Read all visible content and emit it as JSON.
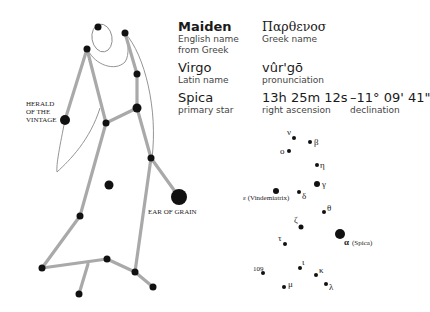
{
  "info": {
    "english_name": {
      "value": "Maiden",
      "label_1": "English name",
      "label_2": "from Greek"
    },
    "greek_name": {
      "value": "Παρθενοσ",
      "label": "Greek name"
    },
    "latin_name": {
      "value": "Virgo",
      "label": "Latin name"
    },
    "pronunciation": {
      "value": "vûr'gō",
      "label": "pronunciation"
    },
    "primary_star": {
      "value": "Spica",
      "label": "primary star"
    },
    "right_ascension": {
      "value": "13h 25m 12s",
      "label": "right ascension"
    },
    "declination": {
      "value": "–11° 09' 41\"",
      "label": "declination"
    }
  },
  "figure": {
    "labels": {
      "herald_1": "HERALD",
      "herald_2": "OF THE",
      "herald_3": "VINTAGE",
      "ear_of_grain": "EAR OF GRAIN"
    }
  },
  "star_map": {
    "stars": [
      {
        "name": "ν",
        "x": 287,
        "y": 139
      },
      {
        "name": "β",
        "x": 310,
        "y": 142
      },
      {
        "name": "ο",
        "x": 289,
        "y": 151
      },
      {
        "name": "η",
        "x": 317,
        "y": 165
      },
      {
        "name": "γ",
        "x": 317,
        "y": 184
      },
      {
        "name": "ε (Vindemiatrix)",
        "x": 276,
        "y": 191
      },
      {
        "name": "δ",
        "x": 299,
        "y": 192
      },
      {
        "name": "θ",
        "x": 324,
        "y": 212
      },
      {
        "name": "ζ",
        "x": 301,
        "y": 227
      },
      {
        "name": "α (Spica)",
        "x": 340,
        "y": 234
      },
      {
        "name": "τ",
        "x": 285,
        "y": 244
      },
      {
        "name": "109",
        "x": 263,
        "y": 273
      },
      {
        "name": "ι",
        "x": 300,
        "y": 268
      },
      {
        "name": "κ",
        "x": 316,
        "y": 275
      },
      {
        "name": "μ",
        "x": 284,
        "y": 287
      },
      {
        "name": "λ",
        "x": 326,
        "y": 284
      }
    ],
    "labels": {
      "nu": "ν",
      "beta": "β",
      "omicron": "ο",
      "eta": "η",
      "gamma": "γ",
      "epsilon": "ε (Vindemiatrix)",
      "delta": "δ",
      "theta": "θ",
      "zeta": "ζ",
      "alpha": "α",
      "alpha_name": "(Spica)",
      "tau": "τ",
      "n109": "109",
      "iota": "ι",
      "kappa": "κ",
      "mu": "μ",
      "lambda": "λ"
    }
  }
}
